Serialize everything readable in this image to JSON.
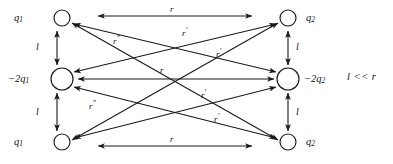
{
  "figure": {
    "condition": "l << r",
    "stroke_color": "#1a1a1a",
    "text_color": "#111111",
    "background": "#ffffff"
  },
  "nodes": {
    "left": [
      {
        "id": "left-top",
        "label_main": "q",
        "label_sub": "1",
        "charge": "q1",
        "cx": 62,
        "cy": 18,
        "r": 8
      },
      {
        "id": "left-middle",
        "label_main": "−2q",
        "label_sub": "1",
        "charge": "-2q1",
        "cx": 62,
        "cy": 79,
        "r": 11
      },
      {
        "id": "left-bottom",
        "label_main": "q",
        "label_sub": "1",
        "charge": "q1",
        "cx": 62,
        "cy": 142,
        "r": 8
      }
    ],
    "right": [
      {
        "id": "right-top",
        "label_main": "q",
        "label_sub": "2",
        "charge": "q2",
        "cx": 288,
        "cy": 18,
        "r": 8
      },
      {
        "id": "right-middle",
        "label_main": "−2q",
        "label_sub": "2",
        "charge": "-2q2",
        "cx": 288,
        "cy": 79,
        "r": 11
      },
      {
        "id": "right-bottom",
        "label_main": "q",
        "label_sub": "2",
        "charge": "q2",
        "cx": 288,
        "cy": 142,
        "r": 8
      }
    ]
  },
  "separations": [
    {
      "id": "left-upper-gap",
      "label": "l",
      "x": 36,
      "y": 44
    },
    {
      "id": "left-lower-gap",
      "label": "l",
      "x": 36,
      "y": 110
    },
    {
      "id": "right-upper-gap",
      "label": "l",
      "x": 300,
      "y": 44
    },
    {
      "id": "right-lower-gap",
      "label": "l",
      "x": 300,
      "y": 110
    }
  ],
  "distances": [
    {
      "id": "top-horizontal",
      "from": "left-top",
      "to": "right-top",
      "label": "r",
      "primes": "",
      "x": 172,
      "y": 6
    },
    {
      "id": "middle-horizontal",
      "from": "left-middle",
      "to": "right-middle",
      "label": "r",
      "primes": "",
      "x": 172,
      "y": 68
    },
    {
      "id": "bottom-horizontal",
      "from": "left-bottom",
      "to": "right-bottom",
      "label": "r",
      "primes": "",
      "x": 172,
      "y": 132
    },
    {
      "id": "upper-diagonal-down",
      "from": "left-top",
      "to": "right-middle",
      "label": "r",
      "primes": "′",
      "x": 185,
      "y": 30
    },
    {
      "id": "upper-diagonal-up",
      "from": "left-middle",
      "to": "right-top",
      "label": "r",
      "primes": "′",
      "x": 215,
      "y": 52
    },
    {
      "id": "lower-diagonal-up",
      "from": "left-bottom",
      "to": "right-middle",
      "label": "r",
      "primes": "′",
      "x": 199,
      "y": 92
    },
    {
      "id": "lower-diagonal-down",
      "from": "left-middle",
      "to": "right-bottom",
      "label": "r",
      "primes": "′",
      "x": 213,
      "y": 116
    },
    {
      "id": "long-diagonal-down",
      "from": "left-top",
      "to": "right-bottom",
      "label": "r",
      "primes": "″",
      "x": 116,
      "y": 38
    },
    {
      "id": "long-diagonal-up",
      "from": "left-bottom",
      "to": "right-top",
      "label": "r",
      "primes": "″",
      "x": 92,
      "y": 103
    }
  ],
  "annotation": {
    "condition_text": "l << r",
    "x": 347,
    "y": 73
  }
}
